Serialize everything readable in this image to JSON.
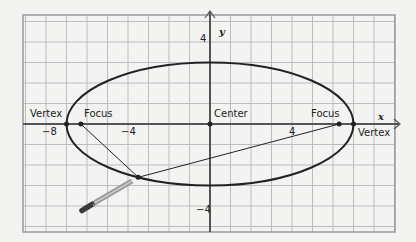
{
  "diagram": {
    "colors": {
      "background": "#f3f3f2",
      "grid": "#bdbdbd",
      "grid_border": "#9a9a9a",
      "axis": "#555555",
      "curve": "#222222",
      "pencil_body": "#8a8a8a",
      "pencil_tip": "#333333"
    },
    "axes": {
      "x_label": "x",
      "y_label": "y",
      "x_ticks": [
        {
          "value": -8,
          "label": "−8"
        },
        {
          "value": -4,
          "label": "−4"
        },
        {
          "value": 4,
          "label": "4"
        }
      ],
      "y_ticks": [
        {
          "value": 4,
          "label": "4"
        },
        {
          "value": -4,
          "label": "−4"
        }
      ],
      "x_range": [
        -9,
        9
      ],
      "y_range": [
        -5,
        5
      ]
    },
    "labels": {
      "left_vertex": "Vertex",
      "left_focus": "Focus",
      "center": "Center",
      "right_focus": "Focus",
      "right_vertex": "Vertex"
    },
    "ellipse": {
      "center": [
        0,
        0
      ],
      "semi_major_a": 7,
      "semi_minor_b": 3,
      "focal_distance_c": 6.3
    },
    "points": {
      "left_vertex": [
        -7,
        0
      ],
      "right_vertex": [
        7,
        0
      ],
      "left_focus": [
        -6.3,
        0
      ],
      "right_focus": [
        6.3,
        0
      ],
      "center": [
        0,
        0
      ],
      "point_on_ellipse": [
        -3.5,
        -2.6
      ]
    },
    "pencil_icon": "pencil"
  }
}
